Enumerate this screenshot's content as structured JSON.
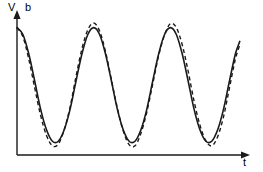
{
  "figure": {
    "width": 263,
    "height": 172,
    "background": "#ffffff",
    "ink_color": "#1a1a1a"
  },
  "labels": {
    "y_axis_primary": "V",
    "y_axis_secondary": "b",
    "x_axis": "t"
  },
  "chart_data": {
    "type": "line",
    "title": "",
    "subtitle": "",
    "xlabel": "t",
    "ylabel": "V",
    "ylabel_secondary": "b",
    "grid": false,
    "legend": null,
    "axes": {
      "x_origin_px": 17,
      "y_origin_px": 155,
      "x_end_px": 248,
      "y_top_px": 13,
      "x_arrow": true,
      "y_arrow": true,
      "ticks": [],
      "tick_labels": []
    },
    "xlim": [
      0,
      3.05
    ],
    "ylim": [
      -1.15,
      1.15
    ],
    "series": [
      {
        "name": "solid-wave",
        "style": "solid",
        "color": "#1a1a1a",
        "width": 1.6,
        "description": "reference sinusoid, three cycles, starts at maximum",
        "amplitude": 1.0,
        "period": 1.0,
        "phase": 0.0,
        "x": [
          0.0,
          0.08,
          0.16,
          0.24,
          0.32,
          0.4,
          0.48,
          0.56,
          0.64,
          0.72,
          0.8,
          0.88,
          0.96,
          1.04,
          1.12,
          1.2,
          1.28,
          1.36,
          1.44,
          1.52,
          1.6,
          1.68,
          1.76,
          1.84,
          1.92,
          2.0,
          2.08,
          2.16,
          2.24,
          2.32,
          2.4,
          2.48,
          2.56,
          2.64,
          2.72,
          2.8,
          2.88,
          2.96,
          3.02
        ],
        "y": [
          1.0,
          0.88,
          0.54,
          0.07,
          -0.42,
          -0.78,
          -0.98,
          -0.98,
          -0.78,
          -0.42,
          0.07,
          0.54,
          0.88,
          1.0,
          0.88,
          0.54,
          0.07,
          -0.42,
          -0.78,
          -0.98,
          -0.98,
          -0.78,
          -0.42,
          0.07,
          0.54,
          0.88,
          1.0,
          0.88,
          0.54,
          0.07,
          -0.42,
          -0.78,
          -0.98,
          -0.98,
          -0.78,
          -0.42,
          0.07,
          0.54,
          0.76
        ]
      },
      {
        "name": "dashed-wave",
        "style": "dashed",
        "dash_pattern": "4,3",
        "color": "#1a1a1a",
        "width": 1.4,
        "description": "comparison sinusoid, slightly larger amplitude and small phase lead",
        "amplitude": 1.08,
        "period": 1.0,
        "phase": 0.03,
        "x": [
          0.0,
          0.08,
          0.16,
          0.24,
          0.32,
          0.4,
          0.48,
          0.56,
          0.64,
          0.72,
          0.8,
          0.88,
          0.96,
          1.04,
          1.12,
          1.2,
          1.28,
          1.36,
          1.44,
          1.52,
          1.6,
          1.68,
          1.76,
          1.84,
          1.92,
          2.0,
          2.08,
          2.16,
          2.24,
          2.32,
          2.4,
          2.48,
          2.56,
          2.64,
          2.72,
          2.8,
          2.88,
          2.96,
          3.02
        ],
        "y": [
          1.0,
          0.84,
          0.45,
          -0.05,
          -0.53,
          -0.88,
          -1.06,
          -1.03,
          -0.78,
          -0.38,
          0.15,
          0.63,
          0.96,
          1.08,
          0.94,
          0.58,
          0.09,
          -0.4,
          -0.8,
          -1.04,
          -1.06,
          -0.84,
          -0.47,
          0.02,
          0.51,
          0.87,
          1.07,
          1.0,
          0.7,
          0.24,
          -0.28,
          -0.7,
          -0.97,
          -1.06,
          -0.9,
          -0.55,
          -0.05,
          0.45,
          0.7
        ]
      }
    ]
  }
}
